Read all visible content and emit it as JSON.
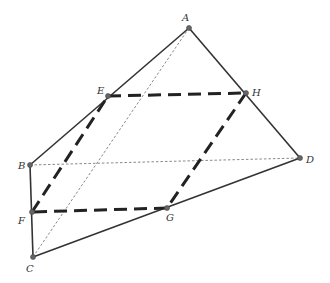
{
  "diagram": {
    "type": "tetrahedron-cross-section",
    "points": {
      "A": {
        "label": "A",
        "x": 189,
        "y": 28,
        "lx": 182,
        "ly": 21
      },
      "B": {
        "label": "B",
        "x": 30,
        "y": 165,
        "lx": 18,
        "ly": 169
      },
      "C": {
        "label": "C",
        "x": 33,
        "y": 257,
        "lx": 26,
        "ly": 272
      },
      "D": {
        "label": "D",
        "x": 300,
        "y": 158,
        "lx": 306,
        "ly": 163
      },
      "E": {
        "label": "E",
        "x": 108,
        "y": 96,
        "lx": 97,
        "ly": 94
      },
      "F": {
        "label": "F",
        "x": 32,
        "y": 212,
        "lx": 18,
        "ly": 224
      },
      "G": {
        "label": "G",
        "x": 167,
        "y": 208,
        "lx": 166,
        "ly": 221
      },
      "H": {
        "label": "H",
        "x": 246,
        "y": 93,
        "lx": 252,
        "ly": 96
      }
    },
    "solid_edges": [
      [
        "A",
        "B"
      ],
      [
        "A",
        "D"
      ],
      [
        "B",
        "C"
      ],
      [
        "C",
        "D"
      ]
    ],
    "hidden_edges": [
      [
        "A",
        "C"
      ],
      [
        "B",
        "D"
      ]
    ],
    "section_edges": [
      [
        "E",
        "H"
      ],
      [
        "H",
        "G"
      ],
      [
        "G",
        "F"
      ],
      [
        "F",
        "E"
      ]
    ],
    "colors": {
      "line": "#333333",
      "background": "#ffffff"
    }
  }
}
